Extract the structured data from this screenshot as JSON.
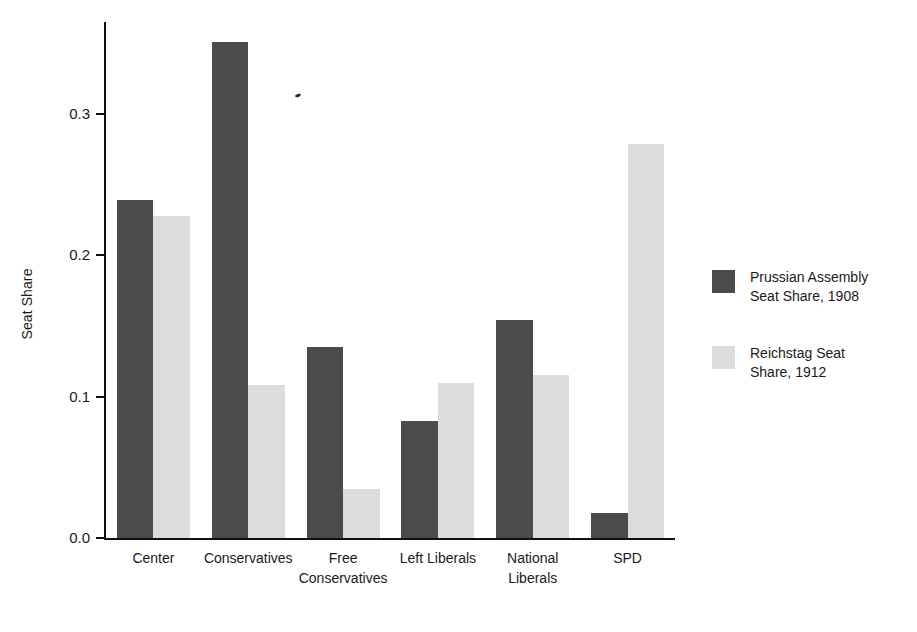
{
  "chart_data": {
    "type": "bar",
    "title": "",
    "xlabel": "",
    "ylabel": "Seat Share",
    "ylim": [
      0.0,
      0.365
    ],
    "grid": false,
    "legend_position": "right",
    "categories": [
      "Center",
      "Conservatives",
      "Free\nConservatives",
      "Left Liberals",
      "National\nLiberals",
      "SPD"
    ],
    "ytick_labels": [
      "0.0",
      "0.1",
      "0.2",
      "0.3"
    ],
    "ytick_values": [
      0.0,
      0.1,
      0.2,
      0.3
    ],
    "series": [
      {
        "name": "Prussian Assembly\nSeat Share, 1908",
        "color": "#4b4b4b",
        "values": [
          0.239,
          0.351,
          0.135,
          0.083,
          0.154,
          0.018
        ]
      },
      {
        "name": "Reichstag Seat\nShare, 1912",
        "color": "#dcdcdc",
        "values": [
          0.228,
          0.108,
          0.035,
          0.11,
          0.115,
          0.279
        ]
      }
    ]
  },
  "axes": {
    "y_label": "Seat Share"
  },
  "legend": {
    "entries": [
      {
        "label": "Prussian Assembly\nSeat Share, 1908",
        "color": "#4b4b4b"
      },
      {
        "label": "Reichstag Seat\nShare, 1912",
        "color": "#dcdcdc"
      }
    ]
  },
  "colors": {
    "series_1": "#4b4b4b",
    "series_2": "#dcdcdc",
    "axis": "#111111",
    "background": "#ffffff"
  }
}
